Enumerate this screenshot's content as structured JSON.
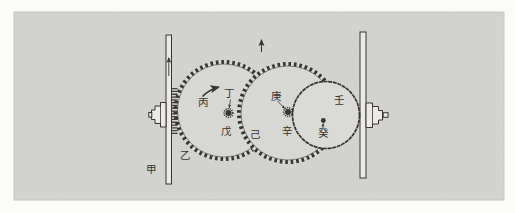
{
  "figure": {
    "kind": "scanned mechanism diagram: belt, gears, wheel transmission",
    "labels": {
      "jia": "甲",
      "yi": "乙",
      "bing": "丙",
      "ding": "丁",
      "wu": "戊",
      "ji": "己",
      "geng": "庚",
      "xin": "辛",
      "ren": "壬",
      "gui": "癸"
    },
    "arrows": {
      "left_belt": "up",
      "mesh_point": "up",
      "gear_rotation": "up-right",
      "ding_pointer": "down-to-axle",
      "geng_pointer": "down-right-to-axle",
      "gui_pointer": "up-to-center-dot"
    },
    "colors": {
      "paper": "#fbfbf9",
      "panel": "#d3d3cf",
      "panel_edge": "#c7c7c2",
      "ink": "#38342f",
      "bar_fill": "#eceae6",
      "gear_fill": "#d7d7d3",
      "wheel_fill": "#dadad6"
    }
  }
}
